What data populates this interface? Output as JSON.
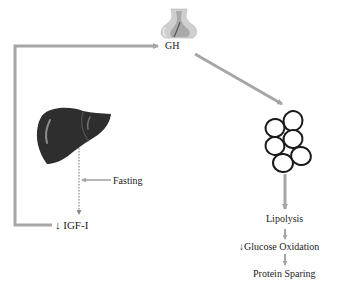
{
  "diagram": {
    "colors": {
      "arrow": "#a6a6a6",
      "liver": "#2e2e2e",
      "text": "#222222",
      "fat_cell_outline": "#1a1a1a"
    },
    "nodes": {
      "gh": {
        "label": "GH",
        "icon": "pituitary-gland-icon"
      },
      "liver": {
        "icon": "liver-icon"
      },
      "fasting": {
        "label": "Fasting"
      },
      "igf": {
        "label": "↓ IGF-I"
      },
      "adipose": {
        "icon": "fat-cells-icon"
      },
      "lipolysis": {
        "label": "Lipolysis"
      },
      "glucose": {
        "label": "↓Glucose Oxidation"
      },
      "protein": {
        "label": "Protein Sparing"
      }
    },
    "edges": [
      {
        "from": "igf",
        "to": "gh",
        "style": "solid-gray",
        "meaning": "feedback"
      },
      {
        "from": "gh",
        "to": "adipose",
        "style": "solid-gray"
      },
      {
        "from": "liver",
        "to": "igf",
        "style": "dotted"
      },
      {
        "from": "fasting",
        "to": "liver-igf-path",
        "style": "solid-gray"
      },
      {
        "from": "adipose",
        "to": "lipolysis",
        "style": "solid-gray"
      },
      {
        "from": "lipolysis",
        "to": "glucose",
        "style": "solid-gray"
      },
      {
        "from": "glucose",
        "to": "protein",
        "style": "solid-gray"
      }
    ]
  }
}
